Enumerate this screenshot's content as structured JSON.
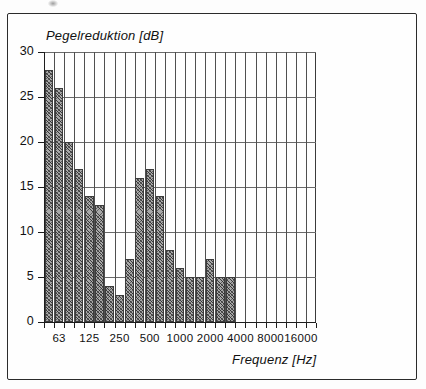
{
  "chart_data": {
    "type": "bar",
    "title": "",
    "xlabel": "Frequenz [Hz]",
    "ylabel": "Pegelreduktion [dB]",
    "ylim": [
      0,
      30
    ],
    "yticks": [
      0,
      5,
      10,
      15,
      20,
      25,
      30
    ],
    "ytick_labels": [
      "0",
      "5",
      "10",
      "15",
      "20",
      "25",
      "30"
    ],
    "xtick_labels": [
      "63",
      "125",
      "250",
      "500",
      "1000",
      "2000",
      "4000",
      "8000",
      "16000"
    ],
    "x_scale": "logarithmic third-octave bands",
    "grid": "both",
    "legend": "none",
    "categories": [
      "50",
      "63",
      "80",
      "100",
      "125",
      "160",
      "200",
      "250",
      "315",
      "400",
      "500",
      "630",
      "800",
      "1000",
      "1250",
      "1600",
      "2000",
      "2500",
      "3150"
    ],
    "values": [
      28,
      26,
      20,
      17,
      14,
      13,
      4,
      3,
      7,
      16,
      17,
      14,
      8,
      6,
      5,
      5,
      7,
      5,
      5
    ],
    "bar_fill": "#a8a8a8",
    "bar_hatch": "cross-hatch",
    "bar_edge_color": "#3c3c3c"
  },
  "axes": {
    "ylabel_text": "Pegelreduktion [dB]",
    "xlabel_text": "Frequenz [Hz]"
  },
  "colors": {
    "frame": "#2b2b2b",
    "gridline": "#5a5a5a",
    "axis": "#1d1d1d",
    "text": "#111111",
    "background": "#ffffff"
  }
}
